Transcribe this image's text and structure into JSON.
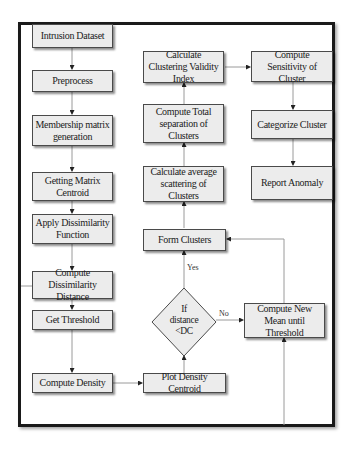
{
  "diagram": {
    "type": "flowchart",
    "nodes": {
      "intrusion_dataset": "Intrusion Dataset",
      "preprocess": "Preprocess",
      "membership": "Membership matrix generation",
      "matrix_centroid": "Getting Matrix Centroid",
      "dissimilarity_function": "Apply Dissimilarity Function",
      "dissimilarity_distance": "Compute Dissimilarity Distance",
      "threshold": "Get Threshold",
      "density": "Compute Density",
      "plot_centroid": "Plot Density Centroid",
      "decision_line1": "If",
      "decision_line2": "distance",
      "decision_line3": "<DC",
      "new_mean": "Compute New Mean until Threshold",
      "form_clusters": "Form Clusters",
      "avg_scattering": "Calculate average scattering of Clusters",
      "total_separation": "Compute Total separation of Clusters",
      "validity_index": "Calculate Clustering Validity Index",
      "sensitivity": "Compute Sensitivity of Cluster",
      "categorize": "Categorize Cluster",
      "report": "Report Anomaly"
    },
    "edge_labels": {
      "yes": "Yes",
      "no": "No"
    },
    "edges": [
      [
        "intrusion_dataset",
        "preprocess"
      ],
      [
        "preprocess",
        "membership"
      ],
      [
        "membership",
        "matrix_centroid"
      ],
      [
        "matrix_centroid",
        "dissimilarity_function"
      ],
      [
        "dissimilarity_function",
        "dissimilarity_distance"
      ],
      [
        "dissimilarity_distance",
        "threshold"
      ],
      [
        "threshold",
        "density"
      ],
      [
        "density",
        "plot_centroid"
      ],
      [
        "plot_centroid",
        "decision"
      ],
      [
        "decision",
        "form_clusters",
        "Yes"
      ],
      [
        "decision",
        "new_mean",
        "No"
      ],
      [
        "new_mean",
        "form_clusters"
      ],
      [
        "form_clusters",
        "avg_scattering"
      ],
      [
        "avg_scattering",
        "total_separation"
      ],
      [
        "total_separation",
        "validity_index"
      ],
      [
        "validity_index",
        "sensitivity"
      ],
      [
        "sensitivity",
        "categorize"
      ],
      [
        "categorize",
        "report"
      ]
    ]
  }
}
